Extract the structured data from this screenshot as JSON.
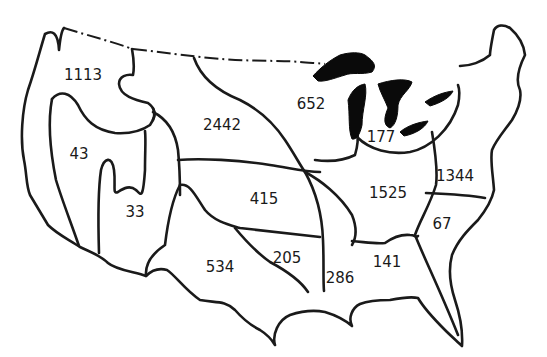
{
  "map": {
    "subject": "United States regions",
    "colors": {
      "line": "#1a1a1a",
      "lakes": "#0a0a0a",
      "background": "#ffffff"
    },
    "regions": [
      {
        "id": "pacific-northwest",
        "label": "1113",
        "x": 83,
        "y": 75
      },
      {
        "id": "california-north",
        "label": "43",
        "x": 79,
        "y": 154
      },
      {
        "id": "great-basin",
        "label": "33",
        "x": 135,
        "y": 212
      },
      {
        "id": "upper-missouri",
        "label": "2442",
        "x": 222,
        "y": 125
      },
      {
        "id": "upper-mississippi",
        "label": "652",
        "x": 311,
        "y": 104
      },
      {
        "id": "great-lakes",
        "label": "177",
        "x": 381,
        "y": 137
      },
      {
        "id": "arkansas-red",
        "label": "415",
        "x": 264,
        "y": 199
      },
      {
        "id": "ohio",
        "label": "1525",
        "x": 388,
        "y": 193
      },
      {
        "id": "mid-atlantic",
        "label": "1344",
        "x": 455,
        "y": 176
      },
      {
        "id": "south-atlantic",
        "label": "67",
        "x": 442,
        "y": 224
      },
      {
        "id": "texas-gulf",
        "label": "534",
        "x": 220,
        "y": 267
      },
      {
        "id": "lower-red",
        "label": "205",
        "x": 287,
        "y": 258
      },
      {
        "id": "lower-mississippi",
        "label": "286",
        "x": 340,
        "y": 278
      },
      {
        "id": "southeast-gulf",
        "label": "141",
        "x": 387,
        "y": 262
      }
    ]
  }
}
